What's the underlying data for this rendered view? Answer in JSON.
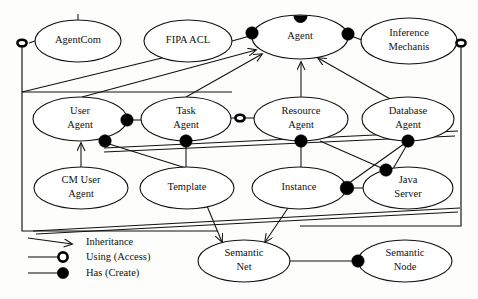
{
  "diagram": {
    "nodes": [
      {
        "id": "agentcom",
        "label_lines": [
          "AgentCom"
        ],
        "cx": 78,
        "cy": 41,
        "rx": 43,
        "ry": 21
      },
      {
        "id": "fipaacl",
        "label_lines": [
          "FIPA ACL"
        ],
        "cx": 188,
        "cy": 41,
        "rx": 44,
        "ry": 21
      },
      {
        "id": "agent",
        "label_lines": [
          "Agent"
        ],
        "cx": 300,
        "cy": 37,
        "rx": 48,
        "ry": 22
      },
      {
        "id": "inference",
        "label_lines": [
          "Inference",
          "Mechanis"
        ],
        "cx": 409,
        "cy": 41,
        "rx": 48,
        "ry": 23
      },
      {
        "id": "useragent",
        "label_lines": [
          "User",
          "Agent"
        ],
        "cx": 80,
        "cy": 119,
        "rx": 47,
        "ry": 22
      },
      {
        "id": "taskagent",
        "label_lines": [
          "Task",
          "Agent"
        ],
        "cx": 186,
        "cy": 119,
        "rx": 45,
        "ry": 22
      },
      {
        "id": "resource",
        "label_lines": [
          "Resource",
          "Agent"
        ],
        "cx": 301,
        "cy": 119,
        "rx": 47,
        "ry": 22
      },
      {
        "id": "database",
        "label_lines": [
          "Database",
          "Agent"
        ],
        "cx": 408,
        "cy": 119,
        "rx": 46,
        "ry": 22
      },
      {
        "id": "cmuser",
        "label_lines": [
          "CM User",
          "Agent"
        ],
        "cx": 81,
        "cy": 188,
        "rx": 47,
        "ry": 21
      },
      {
        "id": "template",
        "label_lines": [
          "Template"
        ],
        "cx": 187,
        "cy": 188,
        "rx": 47,
        "ry": 21
      },
      {
        "id": "instance",
        "label_lines": [
          "Instance"
        ],
        "cx": 299,
        "cy": 188,
        "rx": 47,
        "ry": 21
      },
      {
        "id": "javaserver",
        "label_lines": [
          "Java",
          "Server"
        ],
        "cx": 408,
        "cy": 188,
        "rx": 45,
        "ry": 21
      },
      {
        "id": "semnet",
        "label_lines": [
          "Semantic",
          "Net"
        ],
        "cx": 244,
        "cy": 261,
        "rx": 46,
        "ry": 21
      },
      {
        "id": "semnode",
        "label_lines": [
          "Semantic",
          "Node"
        ],
        "cx": 405,
        "cy": 261,
        "rx": 47,
        "ry": 21
      }
    ],
    "legend": {
      "items": [
        {
          "id": "inheritance",
          "marker": "arrow-marker",
          "label": "Inheritance"
        },
        {
          "id": "using",
          "marker": "open-circle-marker",
          "label": "Using (Access)"
        },
        {
          "id": "has",
          "marker": "filled-circle-marker",
          "label": "Has (Create)"
        }
      ]
    },
    "colors": {
      "stroke": "#111111",
      "fill": "#ffffff",
      "background": "#fdfdfc"
    }
  }
}
